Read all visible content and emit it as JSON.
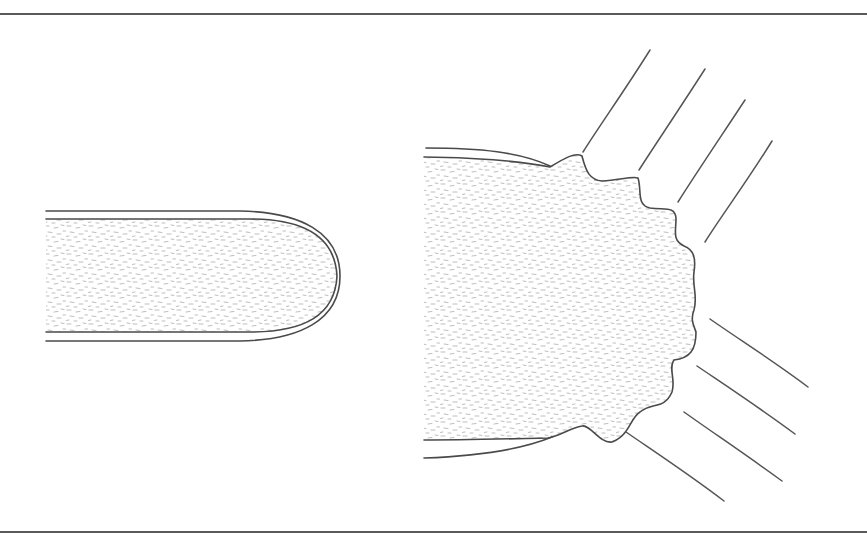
{
  "figure": {
    "description": "Line drawing comparing a smooth rounded rod tip with a burst, frayed end emitting radiating lines",
    "panels": [
      {
        "id": "left",
        "label": "smooth-rounded-end"
      },
      {
        "id": "right",
        "label": "burst-frayed-end"
      }
    ],
    "colors": {
      "stroke": "#4a4a4a",
      "stipple": "#b0b0b0",
      "background": "#ffffff",
      "border": "#5a5a5a"
    },
    "ray_count": {
      "upper": 4,
      "lower": 4
    }
  }
}
